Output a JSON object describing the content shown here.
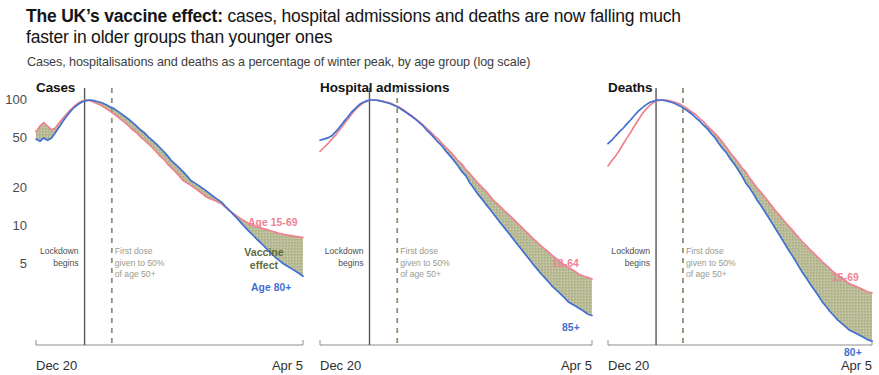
{
  "headline": {
    "lead": "The UK’s vaccine effect:",
    "rest": " cases, hospital admissions and deaths are now falling much faster in older groups than younger ones"
  },
  "subtitle": "Cases, hospitalisations and deaths as a percentage of winter peak, by age group (log scale)",
  "colors": {
    "pink": "#ef8190",
    "blue": "#3f6fd1",
    "fill": "#b9bb96",
    "lockdown_line": "#555555",
    "firstdose_line": "#8f9176",
    "axis": "#8d8d8d",
    "text": "#231f20"
  },
  "axis": {
    "y_ticks": [
      "100",
      "50",
      "20",
      "10",
      "5"
    ],
    "y_values": [
      100,
      50,
      20,
      10,
      5
    ],
    "x_start_label": "Dec 20",
    "x_end_label": "Apr 5",
    "scale": "log"
  },
  "annotations": {
    "lockdown": [
      "Lockdown",
      "begins"
    ],
    "first_dose": [
      "First dose",
      "given to 50%",
      "of age 50+"
    ],
    "vaccine_effect": [
      "Vaccine",
      "effect"
    ]
  },
  "chart_data": {
    "type": "line",
    "title": "The UK’s vaccine effect: cases, hospital admissions and deaths are now falling much faster in older groups than younger ones",
    "subtitle": "Cases, hospitalisations and deaths as a percentage of winter peak, by age group (log scale)",
    "xlabel": "",
    "ylabel": "Percentage of winter peak",
    "yscale": "log",
    "ylim": [
      3,
      130
    ],
    "ygrid": false,
    "yticks": [
      100,
      50,
      20,
      10,
      5
    ],
    "xlim": [
      "Dec 20",
      "Apr 5"
    ],
    "legend_position": "inline-end-of-line",
    "markers": [
      {
        "name": "Lockdown begins",
        "x_frac": 0.182,
        "style": "solid"
      },
      {
        "name": "First dose given to 50% of age 50+",
        "x_frac": 0.284,
        "style": "dashed"
      }
    ],
    "panels": [
      {
        "name": "cases",
        "title": "Cases",
        "shaded_band_label": "Vaccine effect",
        "series": [
          {
            "name": "Age 15-69",
            "color": "#ef8190",
            "label": "Age 15-69",
            "values": [
              56,
              62,
              66,
              62,
              58,
              60,
              66,
              72,
              78,
              84,
              90,
              95,
              98,
              100,
              99,
              96,
              93,
              90,
              86,
              82,
              78,
              74,
              70,
              66,
              62,
              58,
              55,
              51,
              48,
              45,
              42,
              39,
              36,
              34,
              31,
              29,
              27,
              25,
              23,
              22,
              21,
              20,
              19,
              18,
              17,
              16.5,
              16,
              15.5,
              15,
              14,
              13.2,
              12.6,
              12,
              11.4,
              10.9,
              10.5,
              10.1,
              9.9,
              9.7,
              9.5,
              9.3,
              9.1,
              8.9,
              8.7,
              8.6,
              8.5,
              8.4,
              8.3,
              8.2,
              8.1
            ]
          },
          {
            "name": "Age 80+",
            "color": "#3f6fd1",
            "label": "Age 80+",
            "values": [
              49,
              47,
              50,
              48,
              50,
              55,
              61,
              68,
              75,
              82,
              88,
              93,
              97,
              99,
              100,
              99,
              97,
              95,
              92,
              89,
              86,
              82,
              78,
              74,
              70,
              66,
              62,
              58,
              55,
              51,
              48,
              45,
              42,
              39,
              36,
              33,
              31,
              29,
              27,
              25,
              23,
              22,
              21,
              20,
              19,
              18,
              17,
              16.2,
              15.4,
              14.3,
              13.3,
              12.4,
              11.5,
              10.6,
              9.8,
              9.1,
              8.5,
              7.9,
              7.4,
              6.9,
              6.4,
              6.0,
              5.6,
              5.3,
              5.0,
              4.8,
              4.6,
              4.4,
              4.2,
              4.0
            ]
          }
        ]
      },
      {
        "name": "hospital_admissions",
        "title": "Hospital admissions",
        "shaded_band_label": "",
        "series": [
          {
            "name": "18-64",
            "color": "#ef8190",
            "label": "18-64",
            "values": [
              39,
              42,
              45,
              49,
              53,
              58,
              64,
              70,
              77,
              84,
              90,
              95,
              98,
              100,
              100,
              99,
              98,
              96,
              94,
              91,
              88,
              84,
              80,
              76,
              72,
              68,
              64,
              60,
              56,
              52,
              49,
              45,
              42,
              39,
              36,
              33,
              31,
              28,
              26,
              24,
              22,
              20.5,
              19,
              17.5,
              16,
              15,
              14,
              13,
              12.2,
              11.4,
              10.6,
              9.9,
              9.2,
              8.6,
              8.0,
              7.5,
              7.0,
              6.6,
              6.2,
              5.8,
              5.5,
              5.2,
              4.9,
              4.7,
              4.5,
              4.3,
              4.1,
              4.0,
              3.9,
              3.8
            ]
          },
          {
            "name": "85+",
            "color": "#3f6fd1",
            "label": "85+",
            "values": [
              48,
              49,
              50,
              52,
              56,
              61,
              67,
              73,
              80,
              86,
              92,
              96,
              99,
              100,
              100,
              99,
              97,
              95,
              93,
              90,
              87,
              83,
              79,
              75,
              71,
              67,
              63,
              58,
              54,
              50,
              46,
              43,
              39,
              36,
              33,
              30,
              27,
              25,
              22,
              20,
              18,
              16.5,
              15,
              13.7,
              12.5,
              11.4,
              10.4,
              9.5,
              8.7,
              7.9,
              7.2,
              6.6,
              6.0,
              5.5,
              5.0,
              4.6,
              4.2,
              3.9,
              3.6,
              3.3,
              3.1,
              2.9,
              2.7,
              2.5,
              2.4,
              2.3,
              2.2,
              2.1,
              2.0,
              1.95
            ]
          }
        ]
      },
      {
        "name": "deaths",
        "title": "Deaths",
        "shaded_band_label": "",
        "series": [
          {
            "name": "15-69",
            "color": "#ef8190",
            "label": "15-69",
            "values": [
              30,
              33,
              36,
              40,
              45,
              50,
              56,
              63,
              70,
              78,
              85,
              91,
              96,
              99,
              100,
              100,
              99,
              97,
              95,
              92,
              88,
              84,
              80,
              76,
              71,
              67,
              62,
              58,
              54,
              50,
              46,
              42,
              38,
              35,
              32,
              29,
              27,
              24,
              22,
              20,
              18.5,
              17,
              15.5,
              14.2,
              13,
              12,
              11,
              10.2,
              9.4,
              8.7,
              8.0,
              7.4,
              6.9,
              6.4,
              6.0,
              5.6,
              5.2,
              4.9,
              4.6,
              4.3,
              4.1,
              3.9,
              3.7,
              3.5,
              3.4,
              3.3,
              3.2,
              3.1,
              3.0,
              2.95
            ]
          },
          {
            "name": "80+",
            "color": "#3f6fd1",
            "label": "80+",
            "values": [
              45,
              48,
              52,
              56,
              60,
              65,
              70,
              76,
              82,
              87,
              92,
              96,
              98,
              100,
              100,
              99,
              97,
              95,
              92,
              89,
              85,
              81,
              77,
              72,
              68,
              63,
              59,
              54,
              50,
              45,
              41,
              38,
              34,
              31,
              28,
              25,
              22,
              20,
              18,
              16,
              14.5,
              13,
              11.6,
              10.4,
              9.3,
              8.3,
              7.4,
              6.6,
              5.9,
              5.3,
              4.7,
              4.2,
              3.8,
              3.4,
              3.1,
              2.8,
              2.5,
              2.3,
              2.1,
              1.95,
              1.8,
              1.7,
              1.6,
              1.5,
              1.45,
              1.4,
              1.35,
              1.3,
              1.25,
              1.22
            ]
          }
        ]
      }
    ]
  },
  "panel_geometry": [
    {
      "left": 0,
      "width": 310,
      "plot_left": 36,
      "plot_right": 303,
      "title_left": 36
    },
    {
      "left": 310,
      "width": 290,
      "plot_left": 320,
      "plot_right": 592,
      "title_left": 320
    },
    {
      "left": 600,
      "width": 279,
      "plot_left": 608,
      "plot_right": 872,
      "title_left": 608
    }
  ]
}
